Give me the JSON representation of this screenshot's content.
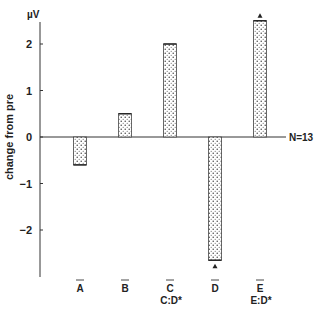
{
  "chart_data": {
    "type": "bar",
    "title": "",
    "xlabel": "",
    "ylabel": "change from pre",
    "yunit": "µV",
    "ylim": [
      -2.9,
      2.7
    ],
    "yticks": [
      2,
      1,
      0,
      -1,
      -2
    ],
    "ytick_labels": [
      "2",
      "1",
      "0",
      "−1",
      "−2"
    ],
    "grid": false,
    "legend": null,
    "categories": [
      "A",
      "B",
      "C",
      "D",
      "E"
    ],
    "category_overbar": true,
    "category_sublabels": [
      "",
      "",
      "C:D*",
      "",
      "E:D*"
    ],
    "values": [
      -0.6,
      0.5,
      2.0,
      -2.65,
      2.5
    ],
    "markers": [
      {
        "category": "D",
        "symbol": "triangle",
        "position": "below bar end"
      },
      {
        "category": "E",
        "symbol": "triangle",
        "position": "above bar end"
      }
    ],
    "annotations": [
      "N=13"
    ],
    "bar_fill": "dotted stipple"
  },
  "labels": {
    "unit": "µV",
    "ylabel": "change from pre",
    "n_label": "N=13"
  },
  "colors": {
    "ink": "#222222",
    "background": "#ffffff"
  }
}
